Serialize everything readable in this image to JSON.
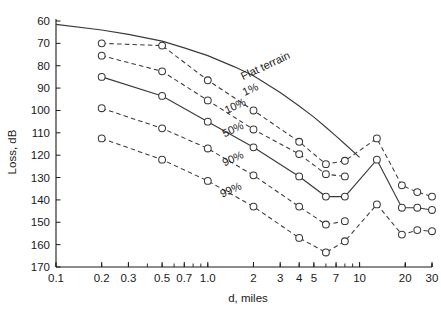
{
  "chart_data": {
    "type": "line",
    "title": "",
    "xlabel": "d, miles",
    "ylabel": "Loss, dB",
    "xscale": "log",
    "xlim": [
      0.1,
      30
    ],
    "ylim": [
      60,
      170
    ],
    "y_inverted": true,
    "grid": false,
    "legend": "inline-annotations",
    "xticks": [
      "0.1",
      "0.2",
      "0.3",
      "0.5",
      "0.7",
      "1.0",
      "2",
      "3",
      "4",
      "5",
      "7",
      "10",
      "20",
      "30"
    ],
    "xtick_values": [
      0.1,
      0.2,
      0.3,
      0.5,
      0.7,
      1.0,
      2,
      3,
      4,
      5,
      7,
      10,
      20,
      30
    ],
    "yticks": [
      "60",
      "70",
      "80",
      "90",
      "100",
      "110",
      "120",
      "130",
      "140",
      "150",
      "160",
      "170"
    ],
    "ytick_values": [
      60,
      70,
      80,
      90,
      100,
      110,
      120,
      130,
      140,
      150,
      160,
      170
    ],
    "series": [
      {
        "name": "Flat terrain",
        "style": "solid",
        "markers": false,
        "x": [
          0.1,
          0.2,
          0.3,
          0.5,
          0.7,
          1.0,
          1.5,
          2.0,
          3.0,
          4.0,
          5.0,
          6.0,
          7.0,
          8.0,
          10.0
        ],
        "y": [
          61.5,
          64.0,
          66.0,
          69.0,
          72.0,
          75.5,
          80.5,
          84.5,
          92.0,
          98.0,
          103.0,
          107.5,
          111.5,
          115.0,
          121.0
        ]
      },
      {
        "name": "1%",
        "style": "dashed",
        "markers": true,
        "x": [
          0.2,
          0.5,
          1.0,
          2.0,
          4.0,
          6.0,
          8.0,
          13.0,
          19.0,
          24.0,
          30.0
        ],
        "y": [
          70.0,
          71.0,
          86.5,
          100.0,
          114.0,
          124.0,
          122.5,
          112.5,
          133.5,
          136.5,
          138.5
        ]
      },
      {
        "name": "10%",
        "style": "dashed",
        "markers": true,
        "x": [
          0.2,
          0.5,
          1.0,
          2.0,
          4.0,
          6.0,
          8.0
        ],
        "y": [
          75.5,
          82.5,
          95.5,
          108.5,
          119.5,
          128.5,
          129.5
        ]
      },
      {
        "name": "50%",
        "style": "solid",
        "markers": true,
        "x": [
          0.2,
          0.5,
          1.0,
          2.0,
          4.0,
          6.0,
          8.0,
          13.0,
          19.0,
          24.0,
          30.0
        ],
        "y": [
          85.0,
          93.5,
          105.0,
          116.5,
          129.5,
          138.5,
          138.5,
          122.0,
          143.5,
          143.5,
          144.5
        ]
      },
      {
        "name": "90%",
        "style": "dashed",
        "markers": true,
        "x": [
          0.2,
          0.5,
          1.0,
          2.0,
          4.0,
          6.0,
          8.0
        ],
        "y": [
          99.0,
          108.0,
          117.0,
          129.0,
          143.0,
          151.0,
          149.5
        ]
      },
      {
        "name": "99%",
        "style": "dashed",
        "markers": true,
        "x": [
          0.2,
          0.5,
          1.0,
          2.0,
          4.0,
          6.0,
          8.0,
          13.0,
          19.0,
          24.0,
          30.0
        ],
        "y": [
          112.5,
          122.0,
          131.5,
          143.0,
          157.0,
          163.5,
          158.5,
          142.0,
          155.5,
          153.5,
          154.0
        ]
      }
    ],
    "annotations": [
      {
        "text": "Flat terrain",
        "x": 2.45,
        "y": 81.5,
        "rotation": -25
      },
      {
        "text": "1%",
        "x": 1.95,
        "y": 92.0,
        "rotation": -25
      },
      {
        "text": "10%",
        "x": 1.55,
        "y": 99.5,
        "rotation": -25
      },
      {
        "text": "50%",
        "x": 1.5,
        "y": 110.0,
        "rotation": -25
      },
      {
        "text": "90%",
        "x": 1.5,
        "y": 123.0,
        "rotation": -25
      },
      {
        "text": "99%",
        "x": 1.45,
        "y": 137.0,
        "rotation": -25
      }
    ]
  },
  "colors": {
    "line": "#3a3a3a",
    "axis": "#1a1a1a",
    "background": "#ffffff",
    "marker_fill": "#ffffff"
  }
}
